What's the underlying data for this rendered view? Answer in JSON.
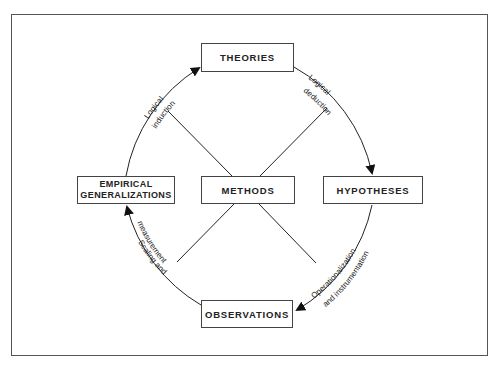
{
  "diagram": {
    "nodes": {
      "theories": "THEORIES",
      "hypotheses": "HYPOTHESES",
      "observations": "OBSERVATIONS",
      "empirical_line1": "EMPIRICAL",
      "empirical_line2": "GENERALIZATIONS",
      "methods": "METHODS"
    },
    "edges": {
      "theories_to_hypotheses": {
        "line1": "Logical",
        "line2": "deduction"
      },
      "hypotheses_to_observations": {
        "line1": "Operationalization",
        "line2": "and instrumentation"
      },
      "observations_to_empirical": {
        "line1": "Scaling and",
        "line2": "measurement"
      },
      "empirical_to_theories": {
        "line1": "Logical",
        "line2": "induction"
      }
    }
  }
}
